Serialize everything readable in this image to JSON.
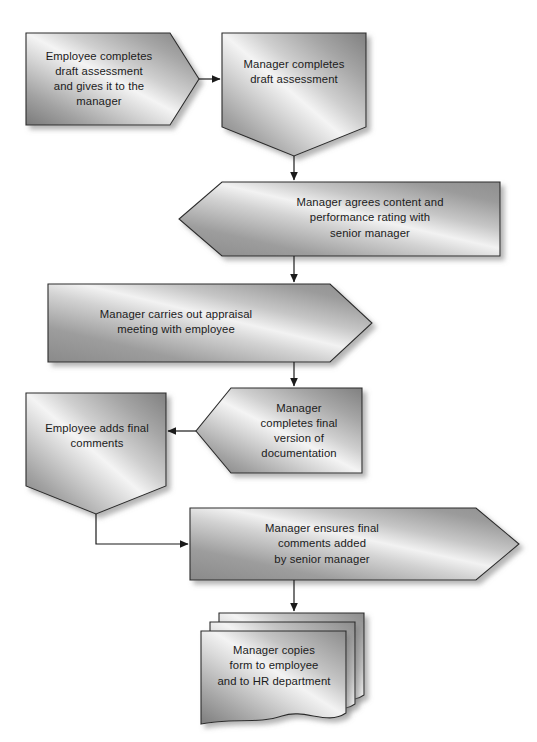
{
  "diagram": {
    "background_color": "#ffffff",
    "text_color": "#1b1b1b",
    "shape_outline_color": "#2c2c2c",
    "shadow_color": "#b9b9b9",
    "gradient": {
      "dark": "#6f6f6f",
      "mid": "#9f9f9f",
      "highlight": "#f2f2f2",
      "light": "#cccccc"
    },
    "connector_color": "#1b1b1b",
    "nodes": [
      {
        "id": "employee-draft",
        "shape": "chevron-right",
        "label": "Employee completes\ndraft assessment\nand gives it to the\nmanager"
      },
      {
        "id": "manager-draft",
        "shape": "pentagon-down",
        "label": "Manager completes\ndraft assessment"
      },
      {
        "id": "manager-agrees",
        "shape": "chevron-notch-left",
        "label": "Manager agrees content and\nperformance rating with\nsenior manager"
      },
      {
        "id": "appraisal-meeting",
        "shape": "arrow-right",
        "label": "Manager carries out appraisal\nmeeting with employee"
      },
      {
        "id": "employee-final-comments",
        "shape": "pentagon-down",
        "label": "Employee adds final\ncomments"
      },
      {
        "id": "final-version",
        "shape": "chevron-notch-left",
        "label": "Manager\ncompletes final\nversion of\ndocumentation"
      },
      {
        "id": "senior-manager-comments",
        "shape": "arrow-right",
        "label": "Manager ensures final\ncomments added\nby senior manager"
      },
      {
        "id": "copies-form",
        "shape": "multi-document",
        "label": "Manager copies\nform to employee\nand to HR department"
      }
    ],
    "connectors": [
      {
        "id": "c1",
        "from": "employee-draft",
        "to": "manager-draft",
        "kind": "straight-right"
      },
      {
        "id": "c2",
        "from": "manager-draft",
        "to": "manager-agrees",
        "kind": "straight-down"
      },
      {
        "id": "c3",
        "from": "manager-agrees",
        "to": "appraisal-meeting",
        "kind": "straight-down"
      },
      {
        "id": "c4",
        "from": "appraisal-meeting",
        "to": "final-version",
        "kind": "straight-down"
      },
      {
        "id": "c5",
        "from": "final-version",
        "to": "employee-final-comments",
        "kind": "straight-left"
      },
      {
        "id": "c6",
        "from": "employee-final-comments",
        "to": "senior-manager-comments",
        "kind": "elbow-down-right"
      },
      {
        "id": "c7",
        "from": "senior-manager-comments",
        "to": "copies-form",
        "kind": "straight-down"
      }
    ]
  }
}
